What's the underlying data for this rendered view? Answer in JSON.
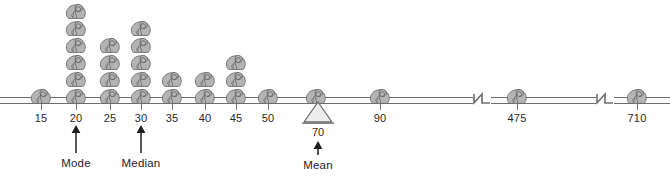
{
  "figure": {
    "unit_icon": "elephant-icon",
    "colors": {
      "elephant_fill": "#b4b4b4",
      "elephant_stroke": "#5a5a5a",
      "axis_line": "#6d6d6d",
      "text": "#1e1e1e",
      "fulcrum_fill": "#e8e8e8",
      "background": "#ffffff"
    }
  },
  "chart_data": {
    "type": "bar",
    "title": "",
    "subtitle": "",
    "xlabel": "",
    "ylabel": "",
    "categories": [
      "15",
      "20",
      "25",
      "30",
      "35",
      "40",
      "45",
      "50",
      "70",
      "90",
      "475",
      "710"
    ],
    "values": [
      1,
      6,
      4,
      5,
      2,
      2,
      3,
      1,
      1,
      1,
      1,
      1
    ],
    "series": [
      {
        "name": "count of elephants",
        "values": [
          1,
          6,
          4,
          5,
          2,
          2,
          3,
          1,
          1,
          1,
          1,
          1
        ]
      }
    ],
    "axis_breaks_after": [
      "90",
      "475"
    ],
    "grid": false,
    "legend": false,
    "ylim": [
      0,
      6
    ],
    "annotations": [
      {
        "label": "Mode",
        "at_category": "20",
        "value": 20,
        "arrow": "up"
      },
      {
        "label": "Median",
        "at_category": "30",
        "value": 30,
        "arrow": "up"
      },
      {
        "label": "Mean",
        "at_category": "70",
        "value": 70,
        "arrow": "up",
        "marker": "fulcrum-triangle"
      }
    ]
  },
  "axis": {
    "tick_labels": [
      "15",
      "20",
      "25",
      "30",
      "35",
      "40",
      "45",
      "50",
      "90",
      "475",
      "710"
    ],
    "break_symbol": "zigzag"
  },
  "annotations": {
    "mode": {
      "label": "Mode",
      "value": "20"
    },
    "median": {
      "label": "Median",
      "value": "30"
    },
    "mean": {
      "label": "Mean",
      "value": "70"
    }
  },
  "stacks": [
    {
      "id": "stack-15",
      "label": "15",
      "count": 1,
      "x": 41
    },
    {
      "id": "stack-20",
      "label": "20",
      "count": 6,
      "x": 76
    },
    {
      "id": "stack-25",
      "label": "25",
      "count": 4,
      "x": 110
    },
    {
      "id": "stack-30",
      "label": "30",
      "count": 5,
      "x": 141
    },
    {
      "id": "stack-35",
      "label": "35",
      "count": 2,
      "x": 172
    },
    {
      "id": "stack-40",
      "label": "40",
      "count": 2,
      "x": 205
    },
    {
      "id": "stack-45",
      "label": "45",
      "count": 3,
      "x": 236
    },
    {
      "id": "stack-50",
      "label": "50",
      "count": 1,
      "x": 268
    },
    {
      "id": "stack-70",
      "label": "70",
      "count": 1,
      "x": 316
    },
    {
      "id": "stack-90",
      "label": "90",
      "count": 1,
      "x": 380
    },
    {
      "id": "stack-475",
      "label": "475",
      "count": 1,
      "x": 517
    },
    {
      "id": "stack-710",
      "label": "710",
      "count": 1,
      "x": 637
    }
  ]
}
